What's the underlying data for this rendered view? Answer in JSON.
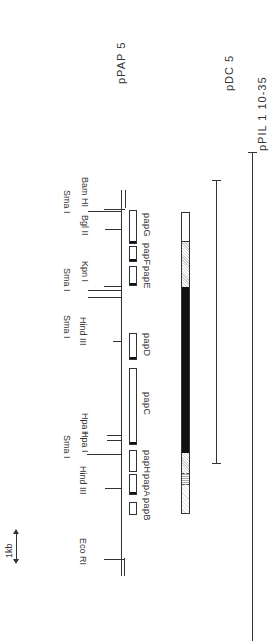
{
  "scale_bar": {
    "label": "1kb"
  },
  "plasmids": [
    {
      "id": "pPAP5",
      "label": "pPAP 5"
    },
    {
      "id": "pDC5",
      "label": "pDC 5"
    },
    {
      "id": "pPIL110-35",
      "label": "pPIL 1 10-35"
    }
  ],
  "restriction_sites": [
    {
      "name": "Bam HI",
      "label": "Bam HI"
    },
    {
      "name": "Sma I",
      "label": "Sma I"
    },
    {
      "name": "Bgl II",
      "label": "Bgl II"
    },
    {
      "name": "Kpn I",
      "label": "Kpn I"
    },
    {
      "name": "Sma I",
      "label": "Sma I"
    },
    {
      "name": "Sma I",
      "label": "Sma I"
    },
    {
      "name": "Hind III",
      "label": "Hind III"
    },
    {
      "name": "Hpa I",
      "label": "Hpa I"
    },
    {
      "name": "Hpa I",
      "label": "Hpa I"
    },
    {
      "name": "Sma I",
      "label": "Sma I"
    },
    {
      "name": "Hind III",
      "label": "Hind III"
    },
    {
      "name": "Eco RI",
      "label": "Eco RI"
    }
  ],
  "genes": [
    {
      "name": "papG",
      "label": "papG"
    },
    {
      "name": "papF",
      "label": "papF"
    },
    {
      "name": "papE",
      "label": "papE"
    },
    {
      "name": "papD",
      "label": "papD"
    },
    {
      "name": "papC",
      "label": "papC"
    },
    {
      "name": "papH",
      "label": "papH"
    },
    {
      "name": "papA",
      "label": "papA"
    },
    {
      "name": "papB",
      "label": "papB"
    }
  ],
  "colors": {
    "line": "#333333",
    "fill_dark": "#111111",
    "stipple": "#d8d8d8",
    "background": "#ffffff"
  }
}
